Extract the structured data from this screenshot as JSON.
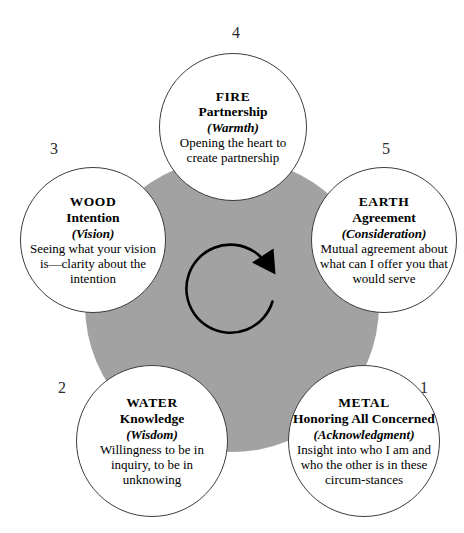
{
  "diagram": {
    "center": {
      "fill_color": "#a2a2a2",
      "arrow": {
        "name": "clockwise-cycle-arrow",
        "direction": "clockwise",
        "color": "#000000"
      }
    },
    "nodes": [
      {
        "id": "fire",
        "step": "4",
        "element": "FIRE",
        "aspect": "Partnership",
        "quality": "(Warmth)",
        "description": "Opening the heart to create partnership"
      },
      {
        "id": "earth",
        "step": "5",
        "element": "EARTH",
        "aspect": "Agreement",
        "quality": "(Consideration)",
        "description": "Mutual agreement about what can I offer you that would serve"
      },
      {
        "id": "metal",
        "step": "1",
        "element": "METAL",
        "aspect": "Honoring All Concerned",
        "quality": "(Acknowledgment)",
        "description": "Insight into who I am and who the other is in these circum-stances"
      },
      {
        "id": "water",
        "step": "2",
        "element": "WATER",
        "aspect": "Knowledge",
        "quality": "(Wisdom)",
        "description": "Willingness to be in inquiry, to be in unknowing"
      },
      {
        "id": "wood",
        "step": "3",
        "element": "WOOD",
        "aspect": "Intention",
        "quality": "(Vision)",
        "description": "Seeing what your vision is—clarity about the intention"
      }
    ]
  }
}
